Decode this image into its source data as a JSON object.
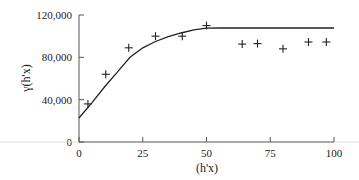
{
  "chart_data": {
    "type": "scatter",
    "title": "",
    "xlabel": "(h'x)",
    "ylabel": "γ(h'x)",
    "xlim": [
      0,
      100
    ],
    "ylim": [
      0,
      120000
    ],
    "x_ticks": [
      0,
      25,
      50,
      75,
      100
    ],
    "x_tick_labels": [
      "0",
      "25",
      "50",
      "75",
      "100"
    ],
    "y_ticks": [
      0,
      40000,
      80000,
      120000
    ],
    "y_tick_labels": [
      "0",
      "40,000",
      "80,000",
      "120,000"
    ],
    "grid": false,
    "legend": null,
    "series": [
      {
        "name": "experimental semivariogram",
        "kind": "scatter",
        "marker": "+",
        "x": [
          3.5,
          10.5,
          19.5,
          30,
          40.5,
          50,
          64,
          70,
          80,
          90,
          97
        ],
        "y": [
          36000,
          64000,
          89000,
          100000,
          100000,
          110000,
          92500,
          93000,
          88000,
          94500,
          94500
        ]
      },
      {
        "name": "fitted model",
        "kind": "line",
        "x": [
          0,
          5,
          10,
          15,
          20,
          25,
          30,
          35,
          40,
          45,
          50,
          55,
          60,
          70,
          80,
          90,
          100
        ],
        "y": [
          22700,
          37000,
          52000,
          66000,
          80000,
          89000,
          95000,
          99500,
          103000,
          106000,
          107500,
          107700,
          107700,
          107700,
          107700,
          107700,
          107700
        ]
      }
    ]
  }
}
